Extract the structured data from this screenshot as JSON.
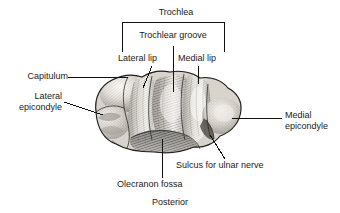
{
  "figure": {
    "title_caption": "Posterior"
  },
  "brackets": {
    "trochlea": {
      "label": "Trochlea"
    },
    "trochlear_groove": {
      "label": "Trochlear groove"
    }
  },
  "labels": {
    "capitulum": "Capitulum",
    "lateral_epicondyle_line1": "Lateral",
    "lateral_epicondyle_line2": "epicondyle",
    "lateral_lip": "Lateral lip",
    "medial_lip": "Medial lip",
    "medial_epicondyle_line1": "Medial",
    "medial_epicondyle_line2": "epicondyle",
    "sulcus_for_ulnar_nerve": "Sulcus for ulnar nerve",
    "olecranon_fossa": "Olecranon fossa",
    "posterior": "Posterior"
  },
  "colors": {
    "text": "#1a1a1a",
    "leader_line": "#111111",
    "background": "#ffffff",
    "bone_light": "#f2efea",
    "bone_mid": "#b8b3ab",
    "bone_dark": "#6e6a64",
    "bone_shadow": "#3f3c38"
  }
}
